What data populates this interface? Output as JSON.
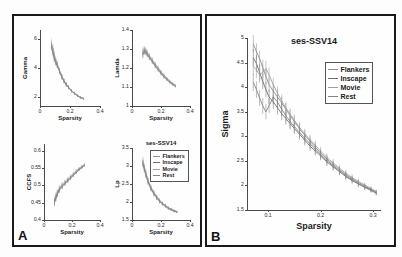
{
  "figure": {
    "panel_a_letter": "A",
    "panel_b_letter": "B",
    "title": "ses-SSV14"
  },
  "legend": {
    "entries": [
      {
        "label": "Flankers",
        "color": "#8f8f8f"
      },
      {
        "label": "Inscape",
        "color": "#6e6e6e"
      },
      {
        "label": "Movie",
        "color": "#a0a0a0"
      },
      {
        "label": "Rest",
        "color": "#858585"
      }
    ]
  },
  "chart_data": [
    {
      "type": "line",
      "id": "gamma",
      "title": "",
      "xlabel": "Sparsity",
      "ylabel": "Gamma",
      "xlim": [
        0,
        0.4
      ],
      "ylim": [
        1.4,
        6.6
      ],
      "xticks": [
        0,
        0.2,
        0.4
      ],
      "xticklabels": [
        "0",
        "0.2",
        "0.4"
      ],
      "yticks": [
        2,
        4,
        6
      ],
      "yticklabels": [
        "2",
        "4",
        "6"
      ],
      "grid": false,
      "errorbars": true,
      "series": [
        {
          "name": "Flankers",
          "color": "#8f8f8f",
          "x": [
            0.075,
            0.085,
            0.095,
            0.105,
            0.115,
            0.13,
            0.145,
            0.16,
            0.175,
            0.19,
            0.21,
            0.23,
            0.25,
            0.27,
            0.29
          ],
          "y": [
            5.65,
            5.4,
            4.95,
            4.55,
            4.3,
            3.85,
            3.45,
            3.15,
            2.9,
            2.7,
            2.45,
            2.28,
            2.12,
            2.0,
            1.92
          ]
        },
        {
          "name": "Inscape",
          "color": "#6e6e6e",
          "x": [
            0.075,
            0.085,
            0.095,
            0.105,
            0.115,
            0.13,
            0.145,
            0.16,
            0.175,
            0.19,
            0.21,
            0.23,
            0.25,
            0.27,
            0.29
          ],
          "y": [
            5.5,
            5.15,
            4.6,
            4.35,
            4.15,
            3.75,
            3.38,
            3.08,
            2.85,
            2.66,
            2.42,
            2.25,
            2.1,
            1.98,
            1.9
          ]
        },
        {
          "name": "Movie",
          "color": "#a0a0a0",
          "x": [
            0.075,
            0.085,
            0.095,
            0.105,
            0.115,
            0.13,
            0.145,
            0.16,
            0.175,
            0.19,
            0.21,
            0.23,
            0.25,
            0.27,
            0.29
          ],
          "y": [
            5.8,
            5.3,
            4.8,
            4.45,
            4.22,
            3.8,
            3.42,
            3.12,
            2.88,
            2.68,
            2.44,
            2.26,
            2.11,
            1.99,
            1.91
          ]
        },
        {
          "name": "Rest",
          "color": "#858585",
          "x": [
            0.075,
            0.085,
            0.095,
            0.105,
            0.115,
            0.13,
            0.145,
            0.16,
            0.175,
            0.19,
            0.21,
            0.23,
            0.25,
            0.27,
            0.29
          ],
          "y": [
            5.45,
            5.05,
            4.7,
            4.4,
            4.18,
            3.78,
            3.4,
            3.1,
            2.86,
            2.67,
            2.43,
            2.27,
            2.1,
            1.97,
            1.88
          ]
        }
      ]
    },
    {
      "type": "line",
      "id": "lamda",
      "title": "",
      "xlabel": "Sparsity",
      "ylabel": "Lamda",
      "xlim": [
        0,
        0.4
      ],
      "ylim": [
        1.0,
        1.4
      ],
      "xticks": [
        0,
        0.2,
        0.4
      ],
      "xticklabels": [
        "0",
        "0.2",
        "0.4"
      ],
      "yticks": [
        1.0,
        1.1,
        1.2,
        1.3,
        1.4
      ],
      "yticklabels": [
        "1",
        "1.1",
        "1.2",
        "1.3",
        "1.4"
      ],
      "grid": false,
      "errorbars": true,
      "series": [
        {
          "name": "Flankers",
          "color": "#8f8f8f",
          "x": [
            0.075,
            0.085,
            0.095,
            0.105,
            0.12,
            0.14,
            0.16,
            0.18,
            0.2,
            0.22,
            0.24,
            0.26,
            0.28,
            0.3
          ],
          "y": [
            1.285,
            1.295,
            1.29,
            1.278,
            1.262,
            1.24,
            1.218,
            1.198,
            1.178,
            1.16,
            1.145,
            1.13,
            1.118,
            1.108
          ]
        },
        {
          "name": "Inscape",
          "color": "#6e6e6e",
          "x": [
            0.075,
            0.085,
            0.095,
            0.105,
            0.12,
            0.14,
            0.16,
            0.18,
            0.2,
            0.22,
            0.24,
            0.26,
            0.28,
            0.3
          ],
          "y": [
            1.272,
            1.288,
            1.285,
            1.272,
            1.256,
            1.234,
            1.212,
            1.192,
            1.172,
            1.155,
            1.14,
            1.126,
            1.114,
            1.104
          ]
        },
        {
          "name": "Movie",
          "color": "#a0a0a0",
          "x": [
            0.075,
            0.085,
            0.095,
            0.105,
            0.12,
            0.14,
            0.16,
            0.18,
            0.2,
            0.22,
            0.24,
            0.26,
            0.28,
            0.3
          ],
          "y": [
            1.292,
            1.3,
            1.294,
            1.282,
            1.266,
            1.244,
            1.222,
            1.202,
            1.182,
            1.164,
            1.148,
            1.133,
            1.12,
            1.11
          ]
        },
        {
          "name": "Rest",
          "color": "#858585",
          "x": [
            0.075,
            0.085,
            0.095,
            0.105,
            0.12,
            0.14,
            0.16,
            0.18,
            0.2,
            0.22,
            0.24,
            0.26,
            0.28,
            0.3
          ],
          "y": [
            1.268,
            1.284,
            1.282,
            1.27,
            1.254,
            1.232,
            1.21,
            1.19,
            1.17,
            1.152,
            1.138,
            1.124,
            1.112,
            1.102
          ]
        }
      ]
    },
    {
      "type": "line",
      "id": "ccfs",
      "title": "",
      "xlabel": "Sparsity",
      "ylabel": "CCFS",
      "xlim": [
        0,
        0.4
      ],
      "ylim": [
        0.4,
        0.62
      ],
      "xticks": [
        0,
        0.2,
        0.4
      ],
      "xticklabels": [
        "0",
        "0.2",
        "0.4"
      ],
      "yticks": [
        0.4,
        0.45,
        0.5,
        0.55,
        0.6
      ],
      "yticklabels": [
        "0.4",
        "0.45",
        "0.5",
        "0.55",
        "0.6"
      ],
      "grid": false,
      "errorbars": true,
      "series": [
        {
          "name": "Flankers",
          "color": "#8f8f8f",
          "x": [
            0.075,
            0.085,
            0.095,
            0.11,
            0.13,
            0.15,
            0.17,
            0.19,
            0.21,
            0.23,
            0.25,
            0.27,
            0.29
          ],
          "y": [
            0.455,
            0.468,
            0.478,
            0.49,
            0.5,
            0.508,
            0.516,
            0.524,
            0.532,
            0.54,
            0.548,
            0.554,
            0.56
          ]
        },
        {
          "name": "Inscape",
          "color": "#6e6e6e",
          "x": [
            0.075,
            0.085,
            0.095,
            0.11,
            0.13,
            0.15,
            0.17,
            0.19,
            0.21,
            0.23,
            0.25,
            0.27,
            0.29
          ],
          "y": [
            0.45,
            0.463,
            0.474,
            0.486,
            0.497,
            0.505,
            0.513,
            0.521,
            0.529,
            0.537,
            0.545,
            0.551,
            0.557
          ]
        },
        {
          "name": "Movie",
          "color": "#a0a0a0",
          "x": [
            0.075,
            0.085,
            0.095,
            0.11,
            0.13,
            0.15,
            0.17,
            0.19,
            0.21,
            0.23,
            0.25,
            0.27,
            0.29
          ],
          "y": [
            0.458,
            0.471,
            0.481,
            0.493,
            0.503,
            0.511,
            0.519,
            0.527,
            0.535,
            0.543,
            0.55,
            0.556,
            0.562
          ]
        },
        {
          "name": "Rest",
          "color": "#858585",
          "x": [
            0.075,
            0.085,
            0.095,
            0.11,
            0.13,
            0.15,
            0.17,
            0.19,
            0.21,
            0.23,
            0.25,
            0.27,
            0.29
          ],
          "y": [
            0.452,
            0.465,
            0.476,
            0.488,
            0.498,
            0.506,
            0.514,
            0.522,
            0.53,
            0.538,
            0.546,
            0.552,
            0.558
          ]
        }
      ]
    },
    {
      "type": "line",
      "id": "lp",
      "title": "ses-SSV14",
      "xlabel": "Sparsity",
      "ylabel": "Lp",
      "xlim": [
        0,
        0.4
      ],
      "ylim": [
        1.5,
        3.5
      ],
      "xticks": [
        0,
        0.2,
        0.4
      ],
      "xticklabels": [
        "0",
        "0.2",
        "0.4"
      ],
      "yticks": [
        1.5,
        2.0,
        2.5,
        3.0,
        3.5
      ],
      "yticklabels": [
        "1.5",
        "2",
        "2.5",
        "3",
        "3.5"
      ],
      "grid": false,
      "errorbars": true,
      "series": [
        {
          "name": "Flankers",
          "color": "#8f8f8f",
          "x": [
            0.075,
            0.085,
            0.095,
            0.11,
            0.13,
            0.15,
            0.17,
            0.19,
            0.21,
            0.23,
            0.25,
            0.27,
            0.29,
            0.31
          ],
          "y": [
            3.12,
            2.95,
            2.8,
            2.6,
            2.4,
            2.26,
            2.14,
            2.04,
            1.96,
            1.9,
            1.84,
            1.8,
            1.76,
            1.73
          ]
        },
        {
          "name": "Inscape",
          "color": "#6e6e6e",
          "x": [
            0.075,
            0.085,
            0.095,
            0.11,
            0.13,
            0.15,
            0.17,
            0.19,
            0.21,
            0.23,
            0.25,
            0.27,
            0.29,
            0.31
          ],
          "y": [
            3.08,
            2.92,
            2.77,
            2.57,
            2.38,
            2.24,
            2.12,
            2.02,
            1.95,
            1.89,
            1.83,
            1.79,
            1.75,
            1.72
          ]
        },
        {
          "name": "Movie",
          "color": "#a0a0a0",
          "x": [
            0.075,
            0.085,
            0.095,
            0.11,
            0.13,
            0.15,
            0.17,
            0.19,
            0.21,
            0.23,
            0.25,
            0.27,
            0.29,
            0.31
          ],
          "y": [
            3.16,
            2.98,
            2.83,
            2.62,
            2.42,
            2.28,
            2.16,
            2.06,
            1.97,
            1.91,
            1.85,
            1.81,
            1.77,
            1.74
          ]
        },
        {
          "name": "Rest",
          "color": "#858585",
          "x": [
            0.075,
            0.085,
            0.095,
            0.11,
            0.13,
            0.15,
            0.17,
            0.19,
            0.21,
            0.23,
            0.25,
            0.27,
            0.29,
            0.31
          ],
          "y": [
            3.05,
            2.9,
            2.75,
            2.55,
            2.36,
            2.22,
            2.11,
            2.01,
            1.94,
            1.88,
            1.82,
            1.78,
            1.74,
            1.71
          ]
        }
      ]
    },
    {
      "type": "line",
      "id": "sigma",
      "title": "ses-SSV14",
      "xlabel": "Sparsity",
      "ylabel": "Sigma",
      "xlim": [
        0.06,
        0.315
      ],
      "ylim": [
        1.5,
        5.0
      ],
      "xticks": [
        0.1,
        0.2,
        0.3
      ],
      "xticklabels": [
        "0.1",
        "0.2",
        "0.3"
      ],
      "yticks": [
        1.5,
        2,
        2.5,
        3,
        3.5,
        4,
        4.5,
        5
      ],
      "yticklabels": [
        "1.5",
        "2",
        "2.5",
        "3",
        "3.5",
        "4",
        "4.5",
        "5"
      ],
      "grid": false,
      "errorbars": true,
      "series": [
        {
          "name": "Flankers",
          "color": "#8f8f8f",
          "x": [
            0.072,
            0.078,
            0.084,
            0.09,
            0.096,
            0.102,
            0.11,
            0.118,
            0.126,
            0.134,
            0.142,
            0.15,
            0.16,
            0.17,
            0.18,
            0.19,
            0.2,
            0.212,
            0.224,
            0.236,
            0.248,
            0.26,
            0.272,
            0.284,
            0.296,
            0.306
          ],
          "y": [
            4.88,
            4.72,
            4.58,
            4.4,
            4.22,
            4.05,
            3.92,
            3.8,
            3.68,
            3.55,
            3.42,
            3.3,
            3.15,
            3.02,
            2.9,
            2.78,
            2.66,
            2.54,
            2.43,
            2.32,
            2.22,
            2.14,
            2.06,
            1.99,
            1.92,
            1.86
          ]
        },
        {
          "name": "Inscape",
          "color": "#6e6e6e",
          "x": [
            0.072,
            0.078,
            0.084,
            0.09,
            0.096,
            0.102,
            0.11,
            0.118,
            0.126,
            0.134,
            0.142,
            0.15,
            0.16,
            0.17,
            0.18,
            0.19,
            0.2,
            0.212,
            0.224,
            0.236,
            0.248,
            0.26,
            0.272,
            0.284,
            0.296,
            0.306
          ],
          "y": [
            4.6,
            4.48,
            4.3,
            4.12,
            3.95,
            3.8,
            3.7,
            3.58,
            3.46,
            3.36,
            3.26,
            3.16,
            3.04,
            2.92,
            2.8,
            2.7,
            2.6,
            2.48,
            2.38,
            2.28,
            2.18,
            2.1,
            2.03,
            1.96,
            1.9,
            1.84
          ]
        },
        {
          "name": "Movie",
          "color": "#a0a0a0",
          "x": [
            0.072,
            0.078,
            0.084,
            0.09,
            0.096,
            0.102,
            0.11,
            0.118,
            0.126,
            0.134,
            0.142,
            0.15,
            0.16,
            0.17,
            0.18,
            0.19,
            0.2,
            0.212,
            0.224,
            0.236,
            0.248,
            0.26,
            0.272,
            0.284,
            0.296,
            0.306
          ],
          "y": [
            4.42,
            4.35,
            4.25,
            4.3,
            4.38,
            4.25,
            4.05,
            3.88,
            3.72,
            3.58,
            3.45,
            3.33,
            3.18,
            3.05,
            2.93,
            2.82,
            2.7,
            2.57,
            2.46,
            2.35,
            2.25,
            2.16,
            2.08,
            2.01,
            1.94,
            1.88
          ]
        },
        {
          "name": "Rest",
          "color": "#858585",
          "x": [
            0.072,
            0.078,
            0.084,
            0.09,
            0.096,
            0.102,
            0.11,
            0.118,
            0.126,
            0.134,
            0.142,
            0.15,
            0.16,
            0.17,
            0.18,
            0.19,
            0.2,
            0.212,
            0.224,
            0.236,
            0.248,
            0.26,
            0.272,
            0.284,
            0.296,
            0.306
          ],
          "y": [
            4.1,
            3.95,
            3.78,
            3.62,
            3.5,
            3.62,
            3.8,
            3.7,
            3.55,
            3.42,
            3.3,
            3.2,
            3.08,
            2.96,
            2.85,
            2.74,
            2.63,
            2.51,
            2.4,
            2.3,
            2.2,
            2.12,
            2.04,
            1.97,
            1.91,
            1.85
          ]
        }
      ]
    }
  ]
}
